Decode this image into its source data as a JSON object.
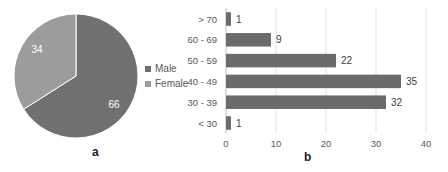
{
  "chart_data": [
    {
      "type": "pie",
      "panel": "a",
      "title": "",
      "categories": [
        "Male",
        "Female"
      ],
      "values": [
        66,
        34
      ],
      "colors": [
        "#707070",
        "#9c9c9c"
      ],
      "legend": [
        "Male",
        "Female"
      ],
      "legend_position": "right"
    },
    {
      "type": "bar",
      "orientation": "horizontal",
      "panel": "b",
      "title": "",
      "categories": [
        "> 70",
        "60 - 69",
        "50 - 59",
        "40 - 49",
        "30 - 39",
        "< 30"
      ],
      "values": [
        1,
        9,
        22,
        35,
        32,
        1
      ],
      "xlabel": "",
      "ylabel": "",
      "xlim": [
        0,
        40
      ],
      "xticks": [
        "0",
        "10",
        "20",
        "30",
        "40"
      ],
      "grid": true,
      "bar_color": "#6b6b6b"
    }
  ],
  "pie": {
    "slices": [
      {
        "label": "Male",
        "value": "66",
        "color": "#707070"
      },
      {
        "label": "Female",
        "value": "34",
        "color": "#9c9c9c"
      }
    ],
    "legend": [
      {
        "label": "Male",
        "color": "#707070"
      },
      {
        "label": "Female",
        "color": "#9c9c9c"
      }
    ],
    "panel_label": "a"
  },
  "bars": {
    "panel_label": "b",
    "ticks": [
      "0",
      "10",
      "20",
      "30",
      "40"
    ],
    "rows": [
      {
        "label": "> 70",
        "value": "1"
      },
      {
        "label": "60 - 69",
        "value": "9"
      },
      {
        "label": "50 - 59",
        "value": "22"
      },
      {
        "label": "40 - 49",
        "value": "35"
      },
      {
        "label": "30 - 39",
        "value": "32"
      },
      {
        "label": "< 30",
        "value": "1"
      }
    ]
  }
}
